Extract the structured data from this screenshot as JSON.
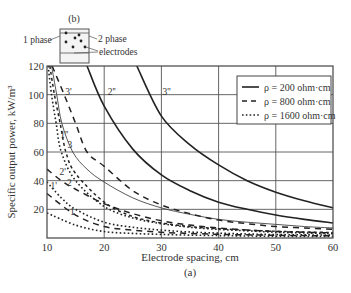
{
  "figure": {
    "inset_label": "(b)",
    "inset_phase1": "1 phase",
    "inset_phase2": "2 phase",
    "inset_electrodes": "electrodes",
    "caption": "(a)"
  },
  "chart_data": {
    "type": "line",
    "title": "",
    "xlabel": "Electrode spacing, cm",
    "ylabel": "Specific output power, kW/m³",
    "xlim": [
      10,
      60
    ],
    "ylim": [
      0,
      120
    ],
    "xticks": [
      10,
      20,
      30,
      40,
      50,
      60
    ],
    "yticks": [
      20,
      40,
      60,
      80,
      100,
      120
    ],
    "grid": true,
    "legend_position": "upper right",
    "legend": [
      {
        "label": "ρ = 200 ohm·cm",
        "style": "solid"
      },
      {
        "label": "ρ = 800 ohm·cm",
        "style": "dashed"
      },
      {
        "label": "ρ = 1600 ohm·cm",
        "style": "dotted"
      }
    ],
    "series": [
      {
        "name": "1''",
        "resistivity": "ρ = 200 ohm·cm",
        "style": "solid-thin",
        "x": [
          10.8,
          11.7,
          12.6,
          14.5,
          17,
          20,
          25,
          30,
          35,
          40,
          45,
          50,
          55,
          60
        ],
        "y": [
          120,
          100,
          80,
          60,
          48,
          39,
          28,
          21,
          16.5,
          13,
          11,
          9.5,
          8,
          7
        ]
      },
      {
        "name": "2''",
        "resistivity": "ρ = 200 ohm·cm",
        "style": "solid",
        "x": [
          17,
          20,
          25,
          30,
          35,
          40,
          45,
          50,
          55,
          60
        ],
        "y": [
          120,
          92,
          62,
          44,
          33,
          25,
          20,
          16,
          13,
          10.5
        ]
      },
      {
        "name": "3''",
        "resistivity": "ρ = 200 ohm·cm",
        "style": "solid",
        "x": [
          25.7,
          30,
          35,
          40,
          45,
          50,
          55,
          60
        ],
        "y": [
          120,
          85,
          65,
          51,
          40,
          32,
          26,
          21
        ]
      },
      {
        "name": "1'",
        "resistivity": "ρ = 800 ohm·cm",
        "style": "dashed",
        "x": [
          10,
          15,
          20,
          25,
          30,
          35,
          40,
          45,
          50,
          55,
          60
        ],
        "y": [
          31,
          16,
          8,
          5.5,
          4,
          3.2,
          2.6,
          2.2,
          1.9,
          1.7,
          1.5
        ]
      },
      {
        "name": "2'",
        "resistivity": "ρ = 800 ohm·cm",
        "style": "dashed",
        "x": [
          10,
          12.5,
          15,
          20,
          25,
          30,
          35,
          40,
          45,
          50,
          55,
          60
        ],
        "y": [
          48,
          40,
          34,
          24,
          17,
          12,
          9,
          7,
          5.5,
          4.5,
          4,
          3.5
        ]
      },
      {
        "name": "3'",
        "resistivity": "ρ = 800 ohm·cm",
        "style": "dashed",
        "x": [
          10.9,
          13,
          15,
          17,
          20,
          25,
          30,
          35,
          40,
          45,
          50,
          55,
          60
        ],
        "y": [
          120,
          100,
          80,
          60,
          50,
          33,
          23,
          17,
          12.5,
          10,
          8,
          7,
          6
        ]
      },
      {
        "name": "1",
        "resistivity": "ρ = 1600 ohm·cm",
        "style": "dotted",
        "x": [
          10,
          15,
          20,
          25,
          30,
          35,
          40,
          45,
          50,
          55,
          60
        ],
        "y": [
          17.5,
          9,
          4.5,
          3.2,
          2.5,
          2,
          1.7,
          1.4,
          1.2,
          1.1,
          1
        ]
      },
      {
        "name": "2",
        "resistivity": "ρ = 1600 ohm·cm",
        "style": "dotted",
        "x": [
          10,
          12.5,
          15,
          20,
          25,
          30,
          35,
          40,
          45,
          50,
          55,
          60
        ],
        "y": [
          39,
          28,
          20,
          11,
          7.5,
          5.5,
          4.2,
          3.4,
          2.8,
          2.4,
          2.2,
          2
        ]
      },
      {
        "name": "3",
        "resistivity": "ρ = 1600 ohm·cm",
        "style": "dotted",
        "x": [
          10.2,
          10.8,
          11.6,
          12.5,
          15,
          20,
          25,
          30,
          35,
          40,
          45,
          50,
          55,
          60
        ],
        "y": [
          120,
          100,
          80,
          60,
          40,
          22,
          14,
          10,
          7.5,
          6,
          5,
          4,
          3.5,
          3
        ]
      },
      {
        "name": "2'' (ρ=800 short-dash)",
        "resistivity": "ρ = 800 ohm·cm",
        "style": "short-dash",
        "x": [
          10.5,
          11.3,
          12.3,
          13.3,
          15,
          20,
          25,
          30,
          35,
          40,
          45,
          50,
          55,
          60
        ],
        "y": [
          120,
          100,
          80,
          60,
          45,
          25,
          15,
          10.5,
          8,
          6.5,
          5.5,
          4.7,
          4.2,
          3.8
        ]
      }
    ],
    "curve_labels": [
      {
        "text": "3'",
        "x": 13.2,
        "y": 100
      },
      {
        "text": "2''",
        "x": 20.6,
        "y": 100
      },
      {
        "text": "3''",
        "x": 30.2,
        "y": 100
      },
      {
        "text": "1''",
        "x": 12.3,
        "y": 70
      },
      {
        "text": "3",
        "x": 13.6,
        "y": 63
      },
      {
        "text": "2'",
        "x": 12.2,
        "y": 44
      },
      {
        "text": "1'",
        "x": 10.6,
        "y": 34
      },
      {
        "text": "2",
        "x": 13.5,
        "y": 36
      },
      {
        "text": "1",
        "x": 14.0,
        "y": 16
      }
    ]
  }
}
